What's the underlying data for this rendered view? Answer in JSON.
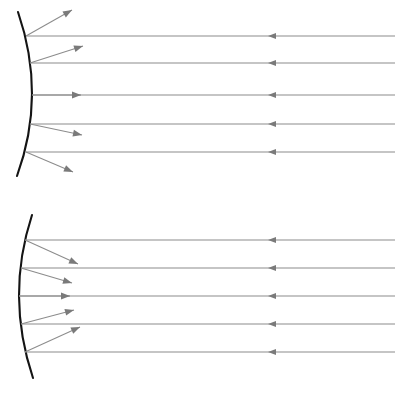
{
  "figure": {
    "background_color": "#ffffff",
    "width": 416,
    "height": 399,
    "mirror_color": "#141414",
    "ray_color": "#8c8c8c",
    "arrow_color": "#7a7a7a"
  },
  "panels": [
    {
      "name": "convex-mirror-panel",
      "label": "Convex mirror: parallel rays reflect divergently",
      "mirror": {
        "name": "convex-mirror",
        "type": "convex",
        "top_point": [
          18,
          12
        ],
        "vertex_point": [
          32,
          95
        ],
        "bottom_point": [
          17,
          176
        ],
        "bulge_direction": "right"
      },
      "axis_y": 95,
      "incident_rays": [
        {
          "y": 36,
          "x_start": 395,
          "x_end": 26,
          "arrow_x": 268,
          "direction": "left"
        },
        {
          "y": 63,
          "x_start": 395,
          "x_end": 30,
          "arrow_x": 268,
          "direction": "left"
        },
        {
          "y": 95,
          "x_start": 395,
          "x_end": 32,
          "arrow_x": 268,
          "direction": "left"
        },
        {
          "y": 124,
          "x_start": 395,
          "x_end": 30,
          "arrow_x": 268,
          "direction": "left"
        },
        {
          "y": 152,
          "x_start": 395,
          "x_end": 26,
          "arrow_x": 268,
          "direction": "left"
        }
      ],
      "reflected_rays": [
        {
          "x_start": 26,
          "y_start": 36,
          "x_end": 72,
          "y_end": 10
        },
        {
          "x_start": 30,
          "y_start": 63,
          "x_end": 83,
          "y_end": 46
        },
        {
          "x_start": 32,
          "y_start": 95,
          "x_end": 81,
          "y_end": 95
        },
        {
          "x_start": 30,
          "y_start": 124,
          "x_end": 82,
          "y_end": 135
        },
        {
          "x_start": 26,
          "y_start": 152,
          "x_end": 73,
          "y_end": 172
        }
      ]
    },
    {
      "name": "concave-mirror-panel",
      "label": "Concave mirror: parallel rays reflect convergently",
      "mirror": {
        "name": "concave-mirror",
        "type": "concave",
        "top_point": [
          32,
          215
        ],
        "vertex_point": [
          19,
          296
        ],
        "bottom_point": [
          33,
          378
        ],
        "bulge_direction": "left"
      },
      "axis_y": 296,
      "incident_rays": [
        {
          "y": 240,
          "x_start": 395,
          "x_end": 25,
          "arrow_x": 268,
          "direction": "left"
        },
        {
          "y": 268,
          "x_start": 395,
          "x_end": 21,
          "arrow_x": 268,
          "direction": "left"
        },
        {
          "y": 296,
          "x_start": 395,
          "x_end": 19,
          "arrow_x": 268,
          "direction": "left"
        },
        {
          "y": 324,
          "x_start": 395,
          "x_end": 21,
          "arrow_x": 268,
          "direction": "left"
        },
        {
          "y": 352,
          "x_start": 395,
          "x_end": 25,
          "arrow_x": 268,
          "direction": "left"
        }
      ],
      "reflected_rays": [
        {
          "x_start": 25,
          "y_start": 240,
          "x_end": 78,
          "y_end": 264
        },
        {
          "x_start": 21,
          "y_start": 268,
          "x_end": 72,
          "y_end": 283
        },
        {
          "x_start": 19,
          "y_start": 296,
          "x_end": 70,
          "y_end": 296
        },
        {
          "x_start": 21,
          "y_start": 324,
          "x_end": 74,
          "y_end": 310
        },
        {
          "x_start": 25,
          "y_start": 352,
          "x_end": 80,
          "y_end": 327
        }
      ]
    }
  ]
}
